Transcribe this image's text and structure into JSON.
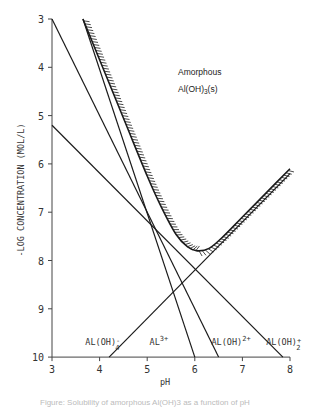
{
  "chart_data": {
    "type": "line",
    "title": "",
    "xlabel": "pH",
    "ylabel": "-log Concentration (mol/L)",
    "xlim": [
      3,
      8
    ],
    "ylim": [
      10,
      3
    ],
    "y_inverted": true,
    "grid": false,
    "xticks": [
      3,
      4,
      5,
      6,
      7,
      8
    ],
    "yticks": [
      3,
      4,
      5,
      6,
      7,
      8,
      9,
      10
    ],
    "annotations": [
      {
        "text": "Amorphous",
        "x": 5.2,
        "y": 4.25
      },
      {
        "text": "Al(OH)3(s)",
        "x": 5.2,
        "y": 4.6
      }
    ],
    "series": [
      {
        "name": "Al3+",
        "label_main": "Al",
        "label_sup": "3+",
        "label_sub": "",
        "points": [
          [
            3.65,
            3.0
          ],
          [
            6.0,
            10.0
          ]
        ],
        "label_pos": [
          5.05,
          9.75
        ]
      },
      {
        "name": "Al(OH)2+",
        "label_main": "Al(OH)",
        "label_sup": "2+",
        "label_sub": "",
        "points": [
          [
            3.0,
            3.0
          ],
          [
            6.5,
            10.0
          ]
        ],
        "label_pos": [
          6.35,
          9.75
        ]
      },
      {
        "name": "Al(OH)2+ (dihydroxo)",
        "label_main": "Al(OH)",
        "label_sup": "+",
        "label_sub": "2",
        "points": [
          [
            3.0,
            5.2
          ],
          [
            7.85,
            10.0
          ]
        ],
        "label_pos": [
          7.5,
          9.75
        ]
      },
      {
        "name": "Al(OH)4-",
        "label_main": "Al(OH)",
        "label_sup": "-",
        "label_sub": "4",
        "points": [
          [
            4.2,
            10.0
          ],
          [
            8.0,
            6.2
          ]
        ],
        "label_pos": [
          3.7,
          9.75
        ]
      },
      {
        "name": "Total solubility (Amorphous Al(OH)3(s))",
        "hatched": true,
        "points": [
          [
            3.65,
            3.0
          ],
          [
            4.5,
            5.05
          ],
          [
            5.0,
            6.25
          ],
          [
            5.3,
            6.9
          ],
          [
            5.6,
            7.45
          ],
          [
            5.85,
            7.72
          ],
          [
            6.05,
            7.8
          ],
          [
            6.3,
            7.75
          ],
          [
            6.6,
            7.5
          ],
          [
            7.0,
            7.1
          ],
          [
            7.5,
            6.6
          ],
          [
            8.0,
            6.1
          ]
        ]
      }
    ]
  },
  "caption": "Figure: Solubility of amorphous Al(OH)3 as a function of pH",
  "colors": {
    "line": "#1a1a1a",
    "axis": "#444444",
    "background": "#ffffff"
  }
}
